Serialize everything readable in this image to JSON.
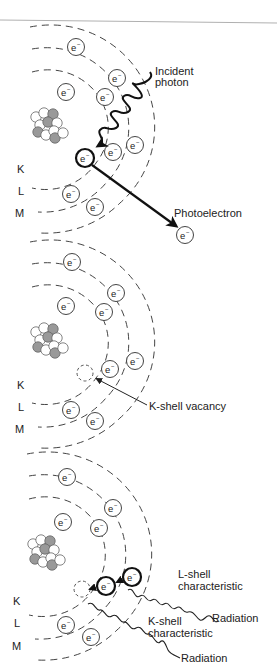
{
  "figure": {
    "shell_labels": [
      "K",
      "L",
      "M"
    ],
    "electron_symbol": "e",
    "electron_charge": "−",
    "panels": [
      {
        "name": "photoelectric-absorption",
        "labels": {
          "incident_line1": "Incident",
          "incident_line2": "photon",
          "photoelectron": "Photoelectron"
        }
      },
      {
        "name": "k-shell-vacancy",
        "labels": {
          "vacancy": "K-shell vacancy"
        }
      },
      {
        "name": "characteristic-radiation",
        "labels": {
          "l_line1": "L-shell",
          "l_line2": "characteristic",
          "l_line3": "Radiation",
          "k_line1": "K-shell",
          "k_line2": "characteristic",
          "k_line3": "Radiation"
        }
      }
    ]
  },
  "colors": {
    "line": "#444444",
    "proton": "#999999",
    "neutron": "#ffffff",
    "divider": "#b0b0b0"
  }
}
